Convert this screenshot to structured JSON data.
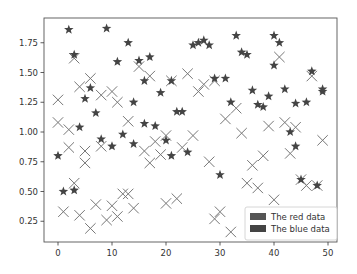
{
  "chart_data": {
    "type": "scatter",
    "title": "",
    "xlabel": "",
    "ylabel": "",
    "xlim": [
      -3,
      52
    ],
    "ylim": [
      0.08,
      1.96
    ],
    "x_ticks": [
      0,
      10,
      20,
      30,
      40,
      50
    ],
    "y_ticks": [
      0.25,
      0.5,
      0.75,
      1.0,
      1.25,
      1.5,
      1.75
    ],
    "x_tick_labels": [
      "0",
      "10",
      "20",
      "30",
      "40",
      "50"
    ],
    "y_tick_labels": [
      "0.25",
      "0.50",
      "0.75",
      "1.00",
      "1.25",
      "1.50",
      "1.75"
    ],
    "grid": false,
    "legend_position": "lower right",
    "series": [
      {
        "name": "The red data",
        "marker": "star",
        "color": "#444444",
        "x": [
          0,
          1,
          2,
          3,
          3,
          4,
          5,
          6,
          7,
          8,
          9,
          10,
          11,
          12,
          13,
          14,
          14,
          15,
          16,
          16,
          17,
          18,
          19,
          20,
          21,
          21,
          22,
          23,
          24,
          25,
          26,
          27,
          28,
          29,
          30,
          31,
          32,
          33,
          34,
          35,
          36,
          37,
          38,
          39,
          40,
          40,
          41,
          42,
          43,
          44,
          44,
          45,
          46,
          47,
          48,
          49,
          49
        ],
        "y": [
          0.8,
          0.5,
          1.86,
          1.65,
          0.51,
          1.04,
          1.28,
          1.37,
          1.16,
          0.94,
          1.87,
          0.88,
          1.59,
          0.98,
          1.75,
          1.25,
          0.9,
          1.6,
          1.43,
          1.07,
          1.63,
          1.05,
          1.33,
          0.93,
          1.43,
          0.8,
          1.17,
          1.17,
          0.83,
          1.73,
          1.75,
          1.77,
          1.73,
          1.45,
          0.64,
          1.45,
          1.25,
          1.81,
          1.67,
          1.65,
          1.35,
          1.23,
          1.21,
          1.3,
          1.56,
          1.81,
          1.75,
          1.36,
          1.0,
          1.24,
          0.88,
          0.6,
          1.25,
          1.51,
          0.55,
          1.34,
          1.36
        ],
        "y_estimated_note": "values read approximately from marker positions"
      },
      {
        "name": "The blue data",
        "marker": "x",
        "color": "#777777",
        "x": [
          0,
          0,
          1,
          2,
          2,
          3,
          3,
          4,
          4,
          5,
          5,
          6,
          6,
          7,
          8,
          8,
          9,
          10,
          10,
          11,
          11,
          12,
          13,
          13,
          14,
          15,
          16,
          17,
          17,
          18,
          19,
          20,
          20,
          21,
          22,
          23,
          24,
          25,
          26,
          27,
          28,
          29,
          29,
          30,
          31,
          32,
          33,
          34,
          35,
          36,
          37,
          38,
          39,
          40,
          41,
          42,
          43,
          44,
          45,
          46,
          47,
          48,
          49
        ],
        "y": [
          1.27,
          1.08,
          0.33,
          1.02,
          0.87,
          1.62,
          0.57,
          1.38,
          0.3,
          0.84,
          0.74,
          1.45,
          0.19,
          0.39,
          0.88,
          1.31,
          0.26,
          0.38,
          1.34,
          0.29,
          1.25,
          0.48,
          0.48,
          1.09,
          0.36,
          1.55,
          0.84,
          0.74,
          1.47,
          0.92,
          0.81,
          0.4,
          0.97,
          1.43,
          0.44,
          0.87,
          1.49,
          0.97,
          1.34,
          1.4,
          0.75,
          0.27,
          1.43,
          0.33,
          1.11,
          0.16,
          1.2,
          0.99,
          0.57,
          0.72,
          0.53,
          0.8,
          1.05,
          0.43,
          1.63,
          1.08,
          0.82,
          1.04,
          0.6,
          0.55,
          1.47,
          0.55,
          0.93
        ],
        "y_estimated_note": "values read approximately from marker positions"
      }
    ]
  },
  "legend": {
    "items": [
      {
        "label": "The red data",
        "color": "#555555"
      },
      {
        "label": "The blue data",
        "color": "#444444"
      }
    ]
  },
  "colors": {
    "axes": "#333333",
    "star_marker": "#444444",
    "x_marker": "#777777",
    "background": "#ffffff"
  }
}
